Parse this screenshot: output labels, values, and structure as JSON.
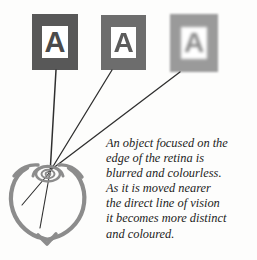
{
  "figure": {
    "background_color": "#fdfdfc",
    "ink_color": "#555555",
    "title": "An object focused on the edge of the retina is blurred and colourless"
  },
  "cards": [
    {
      "letter": "A",
      "label": "letter-card-sharp",
      "card_color": "#585858",
      "plate_color": "#ffffff",
      "letter_color": "#4a4a4a",
      "blur_px": 0,
      "position": {
        "left": 32,
        "top": 14,
        "width": 46,
        "height": 56
      }
    },
    {
      "letter": "A",
      "label": "letter-card-medium",
      "card_color": "#6d6d6d",
      "plate_color": "#ffffff",
      "letter_color": "#5c5c5c",
      "blur_px": 0.4,
      "position": {
        "left": 101,
        "top": 15,
        "width": 45,
        "height": 55
      }
    },
    {
      "letter": "A",
      "label": "letter-card-blurred",
      "card_color": "#9a9a9a",
      "plate_color": "#ffffff",
      "letter_color": "#8a8a8a",
      "blur_px": 1.1,
      "position": {
        "left": 170,
        "top": 14,
        "width": 48,
        "height": 58
      }
    }
  ],
  "rays": {
    "convergence_point": {
      "x": 50,
      "y": 172
    },
    "line_color": "#2f2f2f",
    "count": 3
  },
  "eye": {
    "label": "human eye cross-section",
    "outline_color": "#8c8c8c",
    "center": {
      "x": 47,
      "y": 198
    },
    "radius": 38
  },
  "caption": {
    "line_1": "An object focused on the",
    "line_2": "edge of the retina is",
    "line_3": "blurred and colourless.",
    "line_4": "As it is moved nearer",
    "line_5": "the direct line of vision",
    "line_6": "it becomes more distinct",
    "line_7": "and coloured.",
    "full_text": "An object focused on the edge of the retina is blurred and colourless. As it is moved nearer the direct line of vision it becomes more distinct and coloured."
  }
}
